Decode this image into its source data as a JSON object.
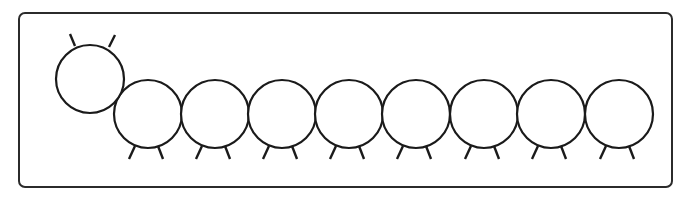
{
  "diagram": {
    "colors": {
      "stroke": "#1a1a1a",
      "frame": "#2b2b2b",
      "fill": "#ffffff"
    },
    "frame": {
      "x": 19,
      "y": 13,
      "width": 653,
      "height": 174,
      "rx": 6
    },
    "head": {
      "cx": 90,
      "cy": 79,
      "r": 34,
      "antennae": [
        {
          "x1": 75,
          "y1": 46,
          "x2": 70,
          "y2": 34
        },
        {
          "x1": 109,
          "y1": 47,
          "x2": 115,
          "y2": 35
        }
      ]
    },
    "body_segment_count": 8,
    "body_segments": [
      {
        "cx": 148,
        "cy": 114,
        "r": 34
      },
      {
        "cx": 215,
        "cy": 114,
        "r": 34
      },
      {
        "cx": 282,
        "cy": 114,
        "r": 34
      },
      {
        "cx": 349,
        "cy": 114,
        "r": 34
      },
      {
        "cx": 416,
        "cy": 114,
        "r": 34
      },
      {
        "cx": 484,
        "cy": 114,
        "r": 34
      },
      {
        "cx": 551,
        "cy": 114,
        "r": 34
      },
      {
        "cx": 619,
        "cy": 114,
        "r": 34
      }
    ]
  }
}
